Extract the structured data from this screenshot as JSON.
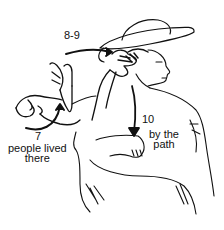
{
  "illustration": {
    "subject": "person in wide-brimmed hat signing",
    "line_color": "#111111",
    "background": "#ffffff"
  },
  "annotations": [
    {
      "id": "step-8-9",
      "number": "8-9",
      "caption": ""
    },
    {
      "id": "step-7",
      "number": "7",
      "caption_line1": "people lived",
      "caption_line2": "there"
    },
    {
      "id": "step-10",
      "number": "10",
      "caption_line1": "by the",
      "caption_line2": "path"
    }
  ]
}
